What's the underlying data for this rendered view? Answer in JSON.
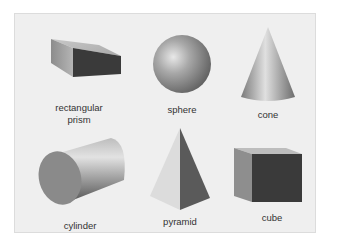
{
  "shapes": [
    {
      "id": "rectangular-prism",
      "label_line1": "rectangular",
      "label_line2": "prism"
    },
    {
      "id": "sphere",
      "label": "sphere"
    },
    {
      "id": "cone",
      "label": "cone"
    },
    {
      "id": "cylinder",
      "label": "cylinder"
    },
    {
      "id": "pyramid",
      "label": "pyramid"
    },
    {
      "id": "cube",
      "label": "cube"
    }
  ],
  "colors": {
    "panel": "#efefef",
    "border": "#dcdcdc",
    "text": "#333333"
  }
}
